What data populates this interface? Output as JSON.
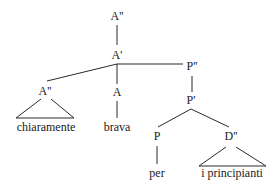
{
  "diagram": {
    "type": "syntax-tree",
    "nodes": {
      "root": {
        "label": "A''"
      },
      "a_bar": {
        "label": "A'"
      },
      "adv_phrase": {
        "label": "A''"
      },
      "adv_word": {
        "label": "chiaramente"
      },
      "head_a": {
        "label": "A"
      },
      "head_word": {
        "label": "brava"
      },
      "pp": {
        "label": "P''"
      },
      "p_bar": {
        "label": "P'"
      },
      "head_p": {
        "label": "P"
      },
      "p_word": {
        "label": "per"
      },
      "dp": {
        "label": "D''"
      },
      "dp_words": {
        "label": "i principianti"
      }
    },
    "edges": [
      [
        "root",
        "a_bar"
      ],
      [
        "a_bar",
        "adv_phrase"
      ],
      [
        "a_bar",
        "head_a"
      ],
      [
        "a_bar",
        "pp"
      ],
      [
        "adv_phrase",
        "adv_word",
        "triangle"
      ],
      [
        "head_a",
        "head_word"
      ],
      [
        "pp",
        "p_bar"
      ],
      [
        "p_bar",
        "head_p"
      ],
      [
        "p_bar",
        "dp"
      ],
      [
        "head_p",
        "p_word"
      ],
      [
        "dp",
        "dp_words",
        "triangle"
      ]
    ],
    "colors": {
      "line": "#2a2a2a",
      "text": "#1a1a1a",
      "background": "#ffffff"
    }
  }
}
